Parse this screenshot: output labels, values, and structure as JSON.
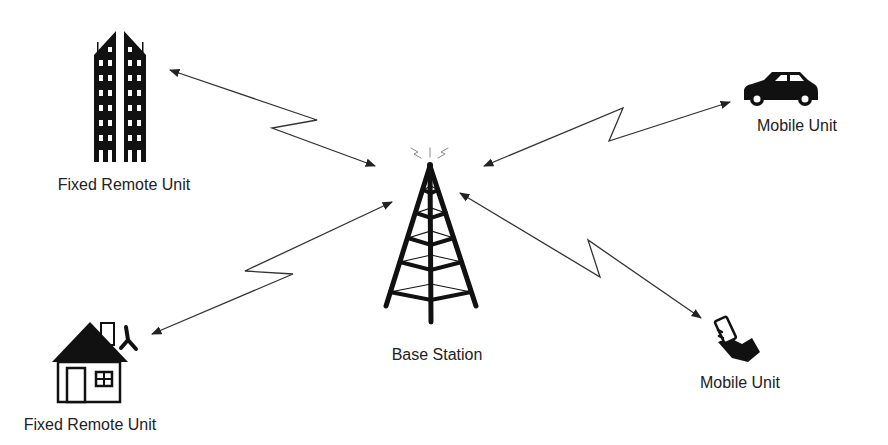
{
  "diagram": {
    "type": "wireless network topology",
    "nodes": [
      {
        "id": "tower",
        "label": "Base Station",
        "icon": "radio-tower-icon"
      },
      {
        "id": "building",
        "label": "Fixed Remote Unit",
        "icon": "office-building-icon"
      },
      {
        "id": "house",
        "label": "Fixed Remote Unit",
        "icon": "house-icon"
      },
      {
        "id": "car",
        "label": "Mobile Unit",
        "icon": "car-icon"
      },
      {
        "id": "phone",
        "label": "Mobile Unit",
        "icon": "hand-phone-icon"
      }
    ],
    "links": [
      {
        "from": "tower",
        "to": "building",
        "style": "bidirectional-lightning"
      },
      {
        "from": "tower",
        "to": "car",
        "style": "bidirectional-lightning"
      },
      {
        "from": "tower",
        "to": "house",
        "style": "bidirectional-lightning"
      },
      {
        "from": "tower",
        "to": "phone",
        "style": "bidirectional-lightning"
      }
    ],
    "colors": {
      "icon": "#111111",
      "link": "#333333",
      "text": "#222222"
    }
  }
}
